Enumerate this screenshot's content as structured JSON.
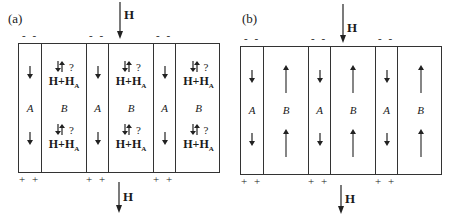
{
  "panels": [
    {
      "label": "(a)",
      "field_label": "H",
      "cells": [
        {
          "name": "A",
          "type": "A",
          "arrow": "down"
        },
        {
          "name": "B",
          "type": "B",
          "arrow": "both",
          "question": "?",
          "field_sum": "H+H",
          "field_sub": "A"
        },
        {
          "name": "A",
          "type": "A",
          "arrow": "down"
        },
        {
          "name": "B",
          "type": "B",
          "arrow": "both",
          "question": "?",
          "field_sum": "H+H",
          "field_sub": "A"
        },
        {
          "name": "A",
          "type": "A",
          "arrow": "down"
        },
        {
          "name": "B",
          "type": "B",
          "arrow": "both",
          "question": "?",
          "field_sum": "H+H",
          "field_sub": "A"
        }
      ],
      "top_charge": "- -",
      "bottom_charge": "+ +"
    },
    {
      "label": "(b)",
      "field_label": "H",
      "cells": [
        {
          "name": "A",
          "type": "A",
          "arrow": "down"
        },
        {
          "name": "B",
          "type": "B",
          "arrow": "up"
        },
        {
          "name": "A",
          "type": "A",
          "arrow": "down"
        },
        {
          "name": "B",
          "type": "B",
          "arrow": "up"
        },
        {
          "name": "A",
          "type": "A",
          "arrow": "down"
        },
        {
          "name": "B",
          "type": "B",
          "arrow": "up"
        }
      ],
      "top_charge": "- -",
      "bottom_charge": "+ +"
    }
  ]
}
